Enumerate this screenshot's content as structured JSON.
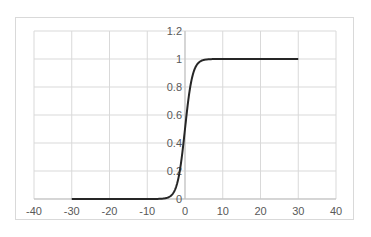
{
  "chart_data": {
    "type": "line",
    "title": "",
    "xlabel": "",
    "ylabel": "",
    "xlim": [
      -40,
      40
    ],
    "ylim": [
      0,
      1.2
    ],
    "grid": true,
    "legend": null,
    "x_ticks": [
      "-40",
      "-30",
      "-20",
      "-10",
      "0",
      "10",
      "20",
      "30",
      "40"
    ],
    "y_ticks": [
      "0",
      "0.2",
      "0.4",
      "0.6",
      "0.8",
      "1",
      "1.2"
    ],
    "series": [
      {
        "name": "sigmoid",
        "color": "#262626",
        "function": "1/(1+exp(-x))",
        "x": [
          -30,
          -20,
          -10,
          -8,
          -6,
          -5,
          -4,
          -3,
          -2,
          -1,
          0,
          1,
          2,
          3,
          4,
          5,
          6,
          8,
          10,
          20,
          30
        ],
        "y": [
          0.0,
          0.0,
          5e-05,
          0.0003,
          0.0025,
          0.0067,
          0.018,
          0.047,
          0.119,
          0.269,
          0.5,
          0.731,
          0.881,
          0.953,
          0.982,
          0.993,
          0.998,
          0.9997,
          0.99995,
          1.0,
          1.0
        ]
      }
    ]
  },
  "colors": {
    "grid": "#d9d9d9",
    "axis": "#bfbfbf",
    "frame": "#d9d9d9",
    "line": "#262626",
    "tick_text": "#595959"
  }
}
